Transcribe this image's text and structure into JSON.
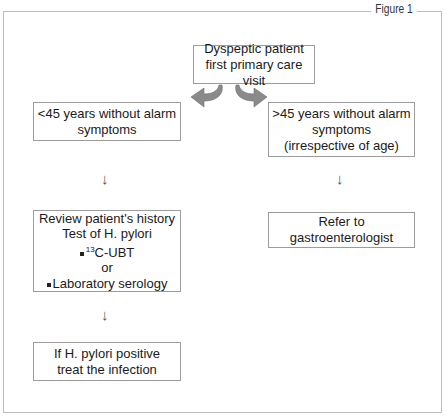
{
  "figure": {
    "label": "Figure 1"
  },
  "nodes": {
    "start": {
      "lines": [
        "Dyspeptic patient",
        "first primary care visit"
      ]
    },
    "left_branch": {
      "lines": [
        "<45 years without alarm",
        "symptoms"
      ]
    },
    "right_branch": {
      "lines": [
        ">45 years without alarm",
        "symptoms",
        "(irrespective of age)"
      ]
    },
    "review": {
      "line1": "Review patient's history",
      "line2": "Test of H. pylori",
      "option1_sup": "13",
      "option1": "C-UBT",
      "or": "or",
      "option2": "Laboratory serology"
    },
    "refer": {
      "lines": [
        "Refer to gastroenterologist"
      ]
    },
    "treat": {
      "lines": [
        "If H. pylori positive",
        "treat the infection"
      ]
    }
  },
  "arrows": {
    "down_glyph": "↓"
  },
  "colors": {
    "arrow_fill": "#8a8a8a",
    "border": "#9c9c9c",
    "frame": "#bdbdbd"
  }
}
